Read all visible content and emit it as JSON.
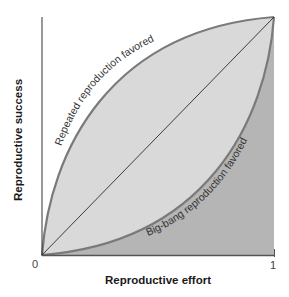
{
  "figure": {
    "type": "diagram",
    "colors": {
      "background": "#ffffff",
      "favored_region_fill": "#d9d9d9",
      "lower_region_fill": "#b5b5b5",
      "curve_stroke": "#7a7a7a",
      "diagonal_stroke": "#2a2a2a",
      "axis_stroke": "#333333",
      "axis_title_color": "#1a1a1a",
      "tick_label_color": "#444444"
    }
  },
  "axes": {
    "x": {
      "title": "Reproductive effort",
      "tick_min": "0",
      "tick_max": "1"
    },
    "y": {
      "title": "Reproductive success"
    }
  },
  "curves": {
    "upper": {
      "label": "Repeated reproduction favored",
      "shape": "concave"
    },
    "lower": {
      "label": "Big-bang reproduction favored",
      "shape": "convex"
    },
    "diagonal": {
      "label": "",
      "shape": "linear"
    }
  }
}
